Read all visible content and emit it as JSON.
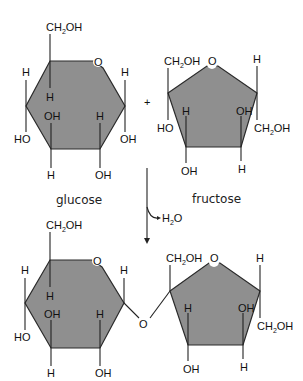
{
  "diagram": {
    "colors": {
      "ring_fill": "#8f8f8f",
      "line": "#222222",
      "background": "#ffffff"
    },
    "operator": "+",
    "reactants": {
      "glucose": {
        "name": "glucose",
        "ring_oxygen": "O",
        "ch2oh": "CH",
        "ch2oh_sub": "2",
        "ch2oh_tail": "OH",
        "substituents": {
          "c1_top": "H",
          "c1_bottom": "OH",
          "c2_top": "H",
          "c2_bottom": "OH",
          "c3_top": "OH",
          "c3_bottom": "H",
          "c4_top": "H",
          "c4_bottom": "HO",
          "c5_down": "H"
        }
      },
      "fructose": {
        "name": "fructose",
        "ring_oxygen": "O",
        "left_ch2oh": "CH",
        "left_ch2oh_sub": "2",
        "left_ch2oh_tail": "OH",
        "right_ch2oh": "CH",
        "right_ch2oh_sub": "2",
        "right_ch2oh_tail": "OH",
        "substituents": {
          "c2_bottom": "HO",
          "c3_top": "H",
          "c3_bottom": "OH",
          "c4_top": "OH",
          "c4_bottom": "H",
          "c5_top": "H"
        }
      }
    },
    "reaction": {
      "byproduct": "H",
      "byproduct_sub": "2",
      "byproduct_tail": "O"
    },
    "product": {
      "glycosidic_oxygen": "O",
      "glucose_ring_oxygen": "O",
      "fructose_ring_oxygen": "O",
      "glucose_ch2oh": "CH",
      "glucose_ch2oh_sub": "2",
      "glucose_ch2oh_tail": "OH",
      "fructose_left_ch2oh": "CH",
      "fructose_left_ch2oh_sub": "2",
      "fructose_left_ch2oh_tail": "OH",
      "fructose_right_ch2oh": "CH",
      "fructose_right_ch2oh_sub": "2",
      "fructose_right_ch2oh_tail": "OH",
      "glucose_substituents": {
        "c1_top": "H",
        "c2_top": "H",
        "c2_bottom": "OH",
        "c3_top": "OH",
        "c3_bottom": "H",
        "c4_top": "H",
        "c4_bottom": "HO",
        "c5_down": "H"
      },
      "fructose_substituents": {
        "c3_top": "H",
        "c3_bottom": "OH",
        "c4_top": "OH",
        "c4_bottom": "H",
        "c5_top": "H"
      }
    }
  }
}
